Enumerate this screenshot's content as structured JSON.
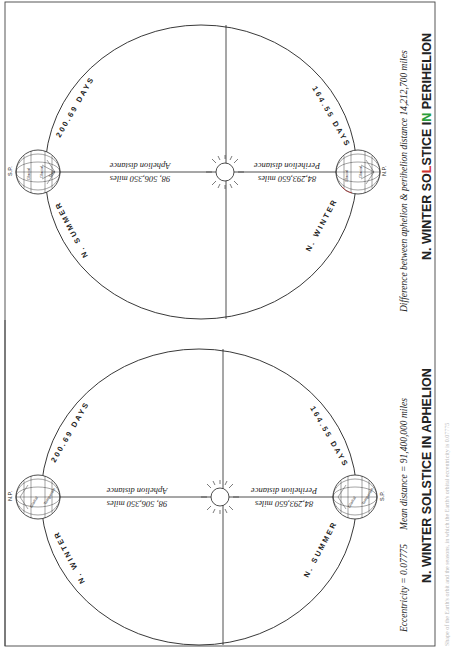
{
  "page": {
    "orientation": "rotated-90-ccw",
    "frame_color": "#444444",
    "line_color": "#222222",
    "accent_green": "#2a9d3a",
    "accent_red": "#d03030"
  },
  "diagrams": [
    {
      "id": "perihelion",
      "title_prefix": "N. WINTER SO",
      "title_highlight_L": "L",
      "title_mid": "STICE I",
      "title_highlight_N": "N",
      "title_suffix": " PERIHELION",
      "title_full": "N. WINTER SOLSTICE IN PERIHELION",
      "caption": "Difference between aphelion & perihelion distance 14,212,700 miles",
      "arc_upper_label": "200.69 DAYS",
      "arc_lower_label": "164.55 DAYS",
      "season_left": "N. SUMMER",
      "season_right": "N. WINTER",
      "aphelion_label": "Aphelion distance",
      "aphelion_value": "98, 506,350 miles",
      "perihelion_label": "Perihelion distance",
      "perihelion_value": "84,293,650 miles",
      "left_pole": "S.P.",
      "right_pole": "N.P.",
      "globe_labels": [
        "Glacial",
        "Glacial",
        "Tem",
        "Temperate"
      ]
    },
    {
      "id": "aphelion",
      "title_full": "N. WINTER SOLSTICE IN APHELION",
      "caption_left": "Eccentricity = 0.07775",
      "caption_right": "Mean distance = 91,400,000 miles",
      "arc_upper_label": "200.69 DAYS",
      "arc_lower_label": "164.55 DAYS",
      "season_left": "N. WINTER",
      "season_right": "N. SUMMER",
      "aphelion_label": "Aphelion distance",
      "aphelion_value": "98, 506,350 miles",
      "perihelion_label": "Perihelion distance",
      "perihelion_value": "84,293,650 miles",
      "left_pole": "N.P.",
      "right_pole": "S.P.",
      "globe_labels": [
        "Glacial",
        "Glacial",
        "Tem",
        "Temperate"
      ]
    }
  ],
  "edge_caption": "Shape of the Earth's orbit and the seasons, in which the Earth's orbital eccentricity is 0.07775"
}
